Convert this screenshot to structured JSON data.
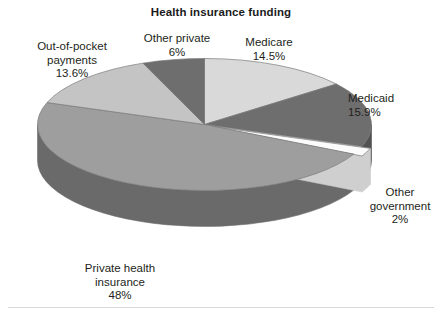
{
  "chart": {
    "title": "Health insurance funding"
  },
  "chart_data": {
    "type": "pie",
    "title": "Health insurance funding",
    "subtitle": "",
    "xlabel": "",
    "ylabel": "",
    "three_d": true,
    "legend_position": "none",
    "labels_position": "outside",
    "grid": false,
    "start_angle_deg": 0,
    "direction": "clockwise",
    "categories": [
      "Medicare",
      "Medicaid",
      "Other government",
      "Private health insurance",
      "Out-of-pocket payments",
      "Other private"
    ],
    "values": [
      14.5,
      15.9,
      2,
      48,
      13.6,
      6
    ],
    "value_labels": [
      "14.5%",
      "15.9%",
      "2%",
      "48%",
      "13.6%",
      "6%"
    ],
    "units": "percent",
    "slices": [
      {
        "name": "Medicare",
        "value": 14.5,
        "value_label": "14.5%",
        "color": "#d9d9d9",
        "side_color": "#a9a9a9",
        "exploded": false
      },
      {
        "name": "Medicaid",
        "value": 15.9,
        "value_label": "15.9%",
        "color": "#6e6e6e",
        "side_color": "#525252",
        "exploded": false
      },
      {
        "name": "Other government",
        "value": 2,
        "value_label": "2%",
        "color": "#fbfbfb",
        "side_color": "#cfcfcf",
        "exploded": true
      },
      {
        "name": "Private health insurance",
        "value": 48,
        "value_label": "48%",
        "color": "#9e9e9e",
        "side_color": "#6a6a6a",
        "exploded": false
      },
      {
        "name": "Out-of-pocket payments",
        "value": 13.6,
        "value_label": "13.6%",
        "color": "#c4c4c4",
        "side_color": "#949494",
        "exploded": false
      },
      {
        "name": "Other private",
        "value": 6,
        "value_label": "6%",
        "color": "#6e6e6e",
        "side_color": "#525252",
        "exploded": false
      }
    ]
  },
  "labels": {
    "medicare": {
      "name": "Medicare",
      "value": "14.5%"
    },
    "medicaid": {
      "name": "Medicaid",
      "value": "15.9%"
    },
    "other_government": {
      "name_line1": "Other",
      "name_line2": "government",
      "value": "2%"
    },
    "private_health": {
      "name_line1": "Private health",
      "name_line2": "insurance",
      "value": "48%"
    },
    "out_of_pocket": {
      "name_line1": "Out-of-pocket",
      "name_line2": "payments",
      "value": "13.6%"
    },
    "other_private": {
      "name": "Other private",
      "value": "6%"
    }
  },
  "colors": {
    "background": "#ffffff",
    "text": "#231f20",
    "rule": "#d8d8d8"
  }
}
